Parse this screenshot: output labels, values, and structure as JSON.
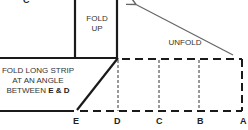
{
  "diagram": {
    "labels": {
      "fold_up": "FOLD UP",
      "fold_up_line1": "FOLD",
      "fold_up_line2": "UP",
      "unfold": "UNFOLD",
      "instruction_line1": "FOLD LONG STRIP",
      "instruction_line2": "AT AN ANGLE",
      "instruction_line3_prefix": "BETWEEN ",
      "instruction_e": "E",
      "instruction_amp": " & ",
      "instruction_d": "D"
    },
    "points": {
      "top_c": "C",
      "e": "E",
      "d": "D",
      "c": "C",
      "b": "B",
      "a": "A"
    },
    "colors": {
      "solid_line": "#1a1a1a",
      "dashed_line": "#1a1a1a",
      "arrow": "#666666",
      "text": "#333333"
    }
  }
}
